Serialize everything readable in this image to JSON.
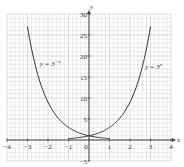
{
  "chart_data": {
    "type": "line",
    "title": "",
    "xlabel": "x",
    "ylabel": "y",
    "xlim": [
      -4,
      4
    ],
    "ylim": [
      -5,
      30
    ],
    "grid": true,
    "x_ticks": [
      -4,
      -3,
      -2,
      -1,
      0,
      1,
      2,
      3,
      4
    ],
    "y_ticks": [
      -5,
      5,
      10,
      15,
      20,
      25,
      30
    ],
    "series": [
      {
        "name": "y = 3^-x",
        "label": "y = 3",
        "label_exp": "−x",
        "x": [
          -3,
          -2.5,
          -2,
          -1.5,
          -1,
          -0.5,
          0,
          0.5,
          1
        ],
        "values": [
          27,
          15.59,
          9,
          5.2,
          3,
          1.73,
          1,
          0.58,
          0.33
        ]
      },
      {
        "name": "y = 3^x",
        "label": "y = 3",
        "label_exp": "x",
        "x": [
          -1,
          -0.5,
          0,
          0.5,
          1,
          1.5,
          2,
          2.5,
          3
        ],
        "values": [
          0.33,
          0.58,
          1,
          1.73,
          3,
          5.2,
          9,
          15.59,
          27
        ]
      }
    ]
  },
  "axis": {
    "x_label": "x",
    "y_label": "y"
  },
  "colors": {
    "grid_minor": "#d9d9d9",
    "grid_major": "#b8b8b8",
    "axis": "#444444",
    "curve": "#333333"
  }
}
